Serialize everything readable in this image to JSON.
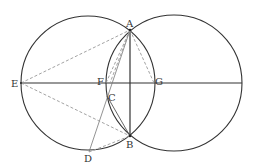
{
  "diagram": {
    "type": "geometry",
    "colors": {
      "solid": "#333333",
      "dashed": "#999999",
      "thin": "#777777"
    },
    "circles": [
      {
        "name": "left-circle",
        "cx": 88,
        "cy": 83,
        "r": 67
      },
      {
        "name": "right-circle",
        "cx": 174,
        "cy": 83,
        "r": 68
      }
    ],
    "points": {
      "A": {
        "x": 130,
        "y": 30
      },
      "B": {
        "x": 130,
        "y": 136
      },
      "C": {
        "x": 107,
        "y": 96
      },
      "D": {
        "x": 89,
        "y": 152
      },
      "E": {
        "x": 21,
        "y": 83
      },
      "F": {
        "x": 106,
        "y": 83
      },
      "G": {
        "x": 154,
        "y": 83
      }
    },
    "labels": {
      "A": "A",
      "B": "B",
      "C": "C",
      "D": "D",
      "E": "E",
      "F": "F",
      "G": "G"
    }
  }
}
